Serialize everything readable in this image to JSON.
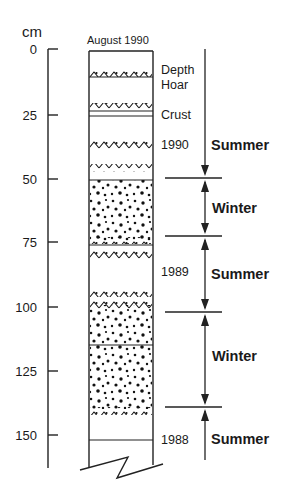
{
  "diagram": {
    "axis": {
      "unit": "cm",
      "ticks": [
        "0",
        "25",
        "50",
        "75",
        "100",
        "125",
        "150"
      ]
    },
    "column_title": "August 1990",
    "layer_notes": {
      "depth_hoar": "Depth Hoar",
      "crust": "Crust",
      "year_1990": "1990",
      "year_1989": "1989",
      "year_1988": "1988"
    },
    "seasons": [
      {
        "label": "Summer",
        "from_cm": 0,
        "to_cm": 50
      },
      {
        "label": "Winter",
        "from_cm": 50,
        "to_cm": 72
      },
      {
        "label": "Summer",
        "from_cm": 72,
        "to_cm": 102
      },
      {
        "label": "Winter",
        "from_cm": 102,
        "to_cm": 139
      },
      {
        "label": "Summer",
        "from_cm": 139,
        "to_cm": 160
      }
    ],
    "layers": [
      {
        "type": "depth-hoar-band",
        "depth_cm": 9
      },
      {
        "type": "depth-hoar-band",
        "depth_cm": 22
      },
      {
        "type": "crust-line",
        "depth_cm": 25
      },
      {
        "type": "depth-hoar-band",
        "depth_cm": 37
      },
      {
        "type": "depth-hoar-band",
        "depth_cm": 47
      },
      {
        "type": "coarse-grain",
        "from_cm": 50,
        "to_cm": 75
      },
      {
        "type": "depth-hoar-band",
        "depth_cm": 74
      },
      {
        "type": "depth-hoar-band",
        "depth_cm": 79
      },
      {
        "type": "depth-hoar-band",
        "depth_cm": 95
      },
      {
        "type": "depth-hoar-band",
        "depth_cm": 99
      },
      {
        "type": "coarse-grain",
        "from_cm": 100,
        "to_cm": 143
      },
      {
        "type": "depth-hoar-band",
        "depth_cm": 141
      },
      {
        "type": "boundary-line",
        "depth_cm": 152
      }
    ]
  }
}
